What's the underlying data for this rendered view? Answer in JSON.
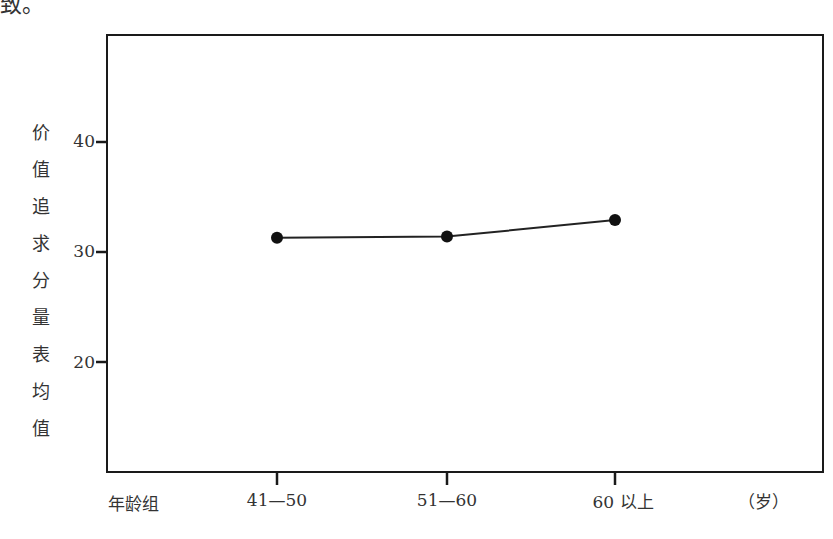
{
  "page": {
    "top_fragment": "致。"
  },
  "chart_data": {
    "type": "line",
    "title": "",
    "xlabel": "年龄组",
    "xunit": "（岁）",
    "ylabel": "价值追求分量表均值",
    "ylabel_chars": [
      "价",
      "值",
      "追",
      "求",
      "分",
      "量",
      "表",
      "均",
      "值"
    ],
    "categories": [
      "41—50",
      "51—60",
      "60 以上"
    ],
    "series": [
      {
        "name": "价值追求分量表均值",
        "values": [
          31.3,
          31.4,
          32.9
        ]
      }
    ],
    "yticks": [
      20,
      30,
      40
    ],
    "ytick_labels": [
      "20",
      "30",
      "40"
    ],
    "ylim": [
      11,
      49
    ],
    "grid": false,
    "legend": "none",
    "colors": {
      "line": "#222222",
      "marker": "#111111",
      "frame": "#1a1a1a"
    }
  }
}
